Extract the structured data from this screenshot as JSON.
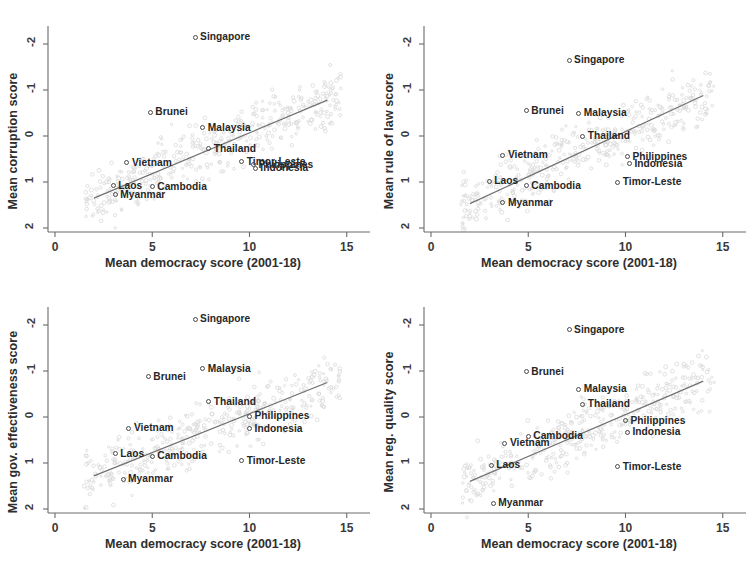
{
  "figure": {
    "type": "scatter-matrix",
    "panel_count": 4,
    "shared_xlabel": "Mean democracy score (2001-18)",
    "xticks": [
      "0",
      "5",
      "10",
      "15"
    ],
    "yticks": [
      "2",
      "1",
      "0",
      "-1",
      "-2"
    ],
    "marker_color": "#4a4a4a",
    "line_color": "#6e6e6e",
    "background_color": "#ffffff"
  },
  "chart_data": [
    {
      "type": "scatter",
      "title": "",
      "xlabel": "Mean democracy score (2001-18)",
      "ylabel": "Mean corruption score",
      "xlim": [
        -1,
        16
      ],
      "ylim": [
        -2.5,
        2.5
      ],
      "xticks": [
        0,
        5,
        10,
        15
      ],
      "yticks": [
        -2,
        -1,
        0,
        1,
        2
      ],
      "grid": false,
      "legend": "none",
      "fit_line": {
        "x": [
          2.0,
          14.0
        ],
        "y": [
          -1.35,
          0.78
        ]
      },
      "points": [
        {
          "label": "Singapore",
          "x": 7.2,
          "y": 2.15,
          "label_pos": "right"
        },
        {
          "label": "Brunei",
          "x": 4.9,
          "y": 0.52,
          "label_pos": "right"
        },
        {
          "label": "Malaysia",
          "x": 7.6,
          "y": 0.18,
          "label_pos": "right"
        },
        {
          "label": "Thailand",
          "x": 7.9,
          "y": -0.28,
          "label_pos": "right"
        },
        {
          "label": "Vietnam",
          "x": 3.7,
          "y": -0.58,
          "label_pos": "right"
        },
        {
          "label": "Timor-Leste",
          "x": 9.6,
          "y": -0.56,
          "label_pos": "right"
        },
        {
          "label": "Philippines",
          "x": 10.2,
          "y": -0.62,
          "label_pos": "right"
        },
        {
          "label": "Indonesia",
          "x": 10.3,
          "y": -0.7,
          "label_pos": "right"
        },
        {
          "label": "Laos",
          "x": 3.0,
          "y": -1.08,
          "label_pos": "right"
        },
        {
          "label": "Cambodia",
          "x": 5.0,
          "y": -1.1,
          "label_pos": "right"
        },
        {
          "label": "Myanmar",
          "x": 3.1,
          "y": -1.28,
          "label_pos": "right"
        }
      ]
    },
    {
      "type": "scatter",
      "title": "",
      "xlabel": "Mean democracy score (2001-18)",
      "ylabel": "Mean rule of law score",
      "xlim": [
        -1,
        16
      ],
      "ylim": [
        -2.5,
        2.5
      ],
      "xticks": [
        0,
        5,
        10,
        15
      ],
      "yticks": [
        -2,
        -1,
        0,
        1,
        2
      ],
      "grid": false,
      "legend": "none",
      "fit_line": {
        "x": [
          2.0,
          14.0
        ],
        "y": [
          -1.47,
          0.88
        ]
      },
      "points": [
        {
          "label": "Singapore",
          "x": 7.1,
          "y": 1.65,
          "label_pos": "right"
        },
        {
          "label": "Brunei",
          "x": 4.9,
          "y": 0.55,
          "label_pos": "right"
        },
        {
          "label": "Malaysia",
          "x": 7.6,
          "y": 0.5,
          "label_pos": "right"
        },
        {
          "label": "Thailand",
          "x": 7.8,
          "y": 0.0,
          "label_pos": "right"
        },
        {
          "label": "Vietnam",
          "x": 3.7,
          "y": -0.42,
          "label_pos": "right"
        },
        {
          "label": "Philippines",
          "x": 10.1,
          "y": -0.45,
          "label_pos": "right"
        },
        {
          "label": "Indonesia",
          "x": 10.2,
          "y": -0.6,
          "label_pos": "right"
        },
        {
          "label": "Laos",
          "x": 3.0,
          "y": -0.98,
          "label_pos": "right"
        },
        {
          "label": "Cambodia",
          "x": 4.9,
          "y": -1.08,
          "label_pos": "right"
        },
        {
          "label": "Timor-Leste",
          "x": 9.6,
          "y": -1.0,
          "label_pos": "right"
        },
        {
          "label": "Myanmar",
          "x": 3.7,
          "y": -1.45,
          "label_pos": "right"
        }
      ]
    },
    {
      "type": "scatter",
      "title": "",
      "xlabel": "Mean democracy score (2001-18)",
      "ylabel": "Mean gov. effectiveness score",
      "xlim": [
        -1,
        16
      ],
      "ylim": [
        -2.5,
        2.5
      ],
      "xticks": [
        0,
        5,
        10,
        15
      ],
      "yticks": [
        -2,
        -1,
        0,
        1,
        2
      ],
      "grid": false,
      "legend": "none",
      "fit_line": {
        "x": [
          2.0,
          14.0
        ],
        "y": [
          -1.28,
          0.75
        ]
      },
      "points": [
        {
          "label": "Singapore",
          "x": 7.2,
          "y": 2.13,
          "label_pos": "right"
        },
        {
          "label": "Malaysia",
          "x": 7.6,
          "y": 1.05,
          "label_pos": "right"
        },
        {
          "label": "Brunei",
          "x": 4.8,
          "y": 0.88,
          "label_pos": "right"
        },
        {
          "label": "Thailand",
          "x": 7.9,
          "y": 0.33,
          "label_pos": "right"
        },
        {
          "label": "Philippines",
          "x": 10.0,
          "y": 0.02,
          "label_pos": "right"
        },
        {
          "label": "Indonesia",
          "x": 10.0,
          "y": -0.25,
          "label_pos": "right"
        },
        {
          "label": "Vietnam",
          "x": 3.8,
          "y": -0.24,
          "label_pos": "right"
        },
        {
          "label": "Laos",
          "x": 3.1,
          "y": -0.8,
          "label_pos": "right"
        },
        {
          "label": "Cambodia",
          "x": 5.0,
          "y": -0.85,
          "label_pos": "right"
        },
        {
          "label": "Timor-Leste",
          "x": 9.6,
          "y": -0.95,
          "label_pos": "right"
        },
        {
          "label": "Myanmar",
          "x": 3.5,
          "y": -1.35,
          "label_pos": "right"
        }
      ]
    },
    {
      "type": "scatter",
      "title": "",
      "xlabel": "Mean democracy score (2001-18)",
      "ylabel": "Mean reg. quality score",
      "xlim": [
        -1,
        16
      ],
      "ylim": [
        -2.5,
        2.5
      ],
      "xticks": [
        0,
        5,
        10,
        15
      ],
      "yticks": [
        -2,
        -1,
        0,
        1,
        2
      ],
      "grid": false,
      "legend": "none",
      "fit_line": {
        "x": [
          2.0,
          14.0
        ],
        "y": [
          -1.4,
          0.78
        ]
      },
      "points": [
        {
          "label": "Singapore",
          "x": 7.1,
          "y": 1.9,
          "label_pos": "right"
        },
        {
          "label": "Brunei",
          "x": 4.9,
          "y": 0.98,
          "label_pos": "right"
        },
        {
          "label": "Malaysia",
          "x": 7.6,
          "y": 0.6,
          "label_pos": "right"
        },
        {
          "label": "Thailand",
          "x": 7.8,
          "y": 0.28,
          "label_pos": "right"
        },
        {
          "label": "Philippines",
          "x": 10.0,
          "y": -0.08,
          "label_pos": "right"
        },
        {
          "label": "Indonesia",
          "x": 10.1,
          "y": -0.33,
          "label_pos": "right"
        },
        {
          "label": "Cambodia",
          "x": 5.0,
          "y": -0.42,
          "label_pos": "right"
        },
        {
          "label": "Vietnam",
          "x": 3.8,
          "y": -0.57,
          "label_pos": "right"
        },
        {
          "label": "Laos",
          "x": 3.1,
          "y": -1.05,
          "label_pos": "right"
        },
        {
          "label": "Timor-Leste",
          "x": 9.6,
          "y": -1.08,
          "label_pos": "right"
        },
        {
          "label": "Myanmar",
          "x": 3.2,
          "y": -1.87,
          "label_pos": "right"
        }
      ]
    }
  ]
}
